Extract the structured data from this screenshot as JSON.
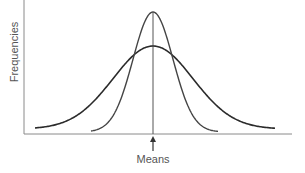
{
  "chart_data": {
    "type": "line",
    "title": "",
    "xlabel": "",
    "ylabel": "Frequencies",
    "annotations": [
      {
        "text": "Means",
        "position": "center of x-axis, arrow pointing up to shared mean"
      }
    ],
    "grid": false,
    "legend": null,
    "series": [
      {
        "name": "narrow distribution",
        "shape": "normal",
        "mean": 0,
        "relative_sd": 0.5,
        "relative_peak": 1.0
      },
      {
        "name": "wide distribution",
        "shape": "normal",
        "mean": 0,
        "relative_sd": 1.0,
        "relative_peak": 0.7
      }
    ],
    "x_ticks": [],
    "y_ticks": []
  },
  "labels": {
    "y_axis": "Frequencies",
    "annotation": "Means"
  },
  "colors": {
    "curve": "#2b2b2b",
    "axis": "#8a8a8a"
  }
}
